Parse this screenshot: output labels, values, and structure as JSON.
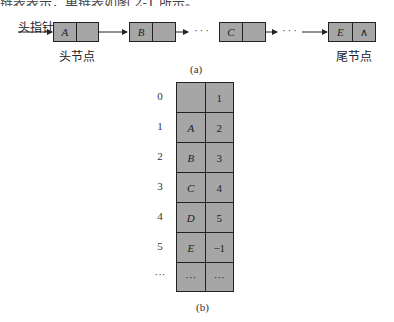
{
  "clipped_heading": "链表表示，单链表如图 2-1 所示。",
  "figure_a": {
    "head_pointer_label": "头指针",
    "head_node_label": "头节点",
    "tail_node_label": "尾节点",
    "caption": "(a)",
    "ellipsis": "···",
    "nodes": [
      {
        "data": "A",
        "next": ""
      },
      {
        "data": "B",
        "next": ""
      },
      {
        "data": "C",
        "next": ""
      },
      {
        "data": "E",
        "next": "∧"
      }
    ]
  },
  "figure_b": {
    "caption": "(b)",
    "rows": [
      {
        "index": "0",
        "data": "",
        "next": "1"
      },
      {
        "index": "1",
        "data": "A",
        "next": "2"
      },
      {
        "index": "2",
        "data": "B",
        "next": "3"
      },
      {
        "index": "3",
        "data": "C",
        "next": "4"
      },
      {
        "index": "4",
        "data": "D",
        "next": "5"
      },
      {
        "index": "5",
        "data": "E",
        "next": "−1"
      },
      {
        "index": "···",
        "data": "···",
        "next": "···"
      }
    ]
  },
  "colors": {
    "node_fill": "#a6a6a6",
    "stroke": "#222222"
  }
}
